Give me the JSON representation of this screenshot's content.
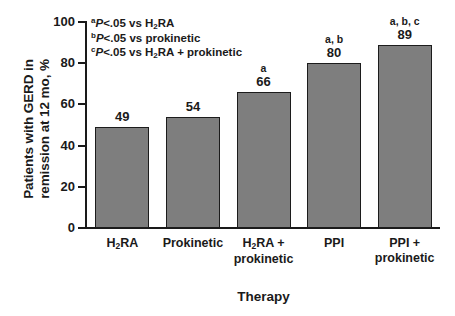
{
  "chart_data": {
    "type": "bar",
    "title": "",
    "categories": [
      "H2RA",
      "Prokinetic",
      "H2RA + prokinetic",
      "PPI",
      "PPI + prokinetic"
    ],
    "category_labels": [
      {
        "line1_pre": "H",
        "line1_sub": "2",
        "line1_post": "RA",
        "line2": ""
      },
      {
        "line1_pre": "Prokinetic",
        "line1_sub": "",
        "line1_post": "",
        "line2": ""
      },
      {
        "line1_pre": "H",
        "line1_sub": "2",
        "line1_post": "RA +",
        "line2": "prokinetic"
      },
      {
        "line1_pre": "PPI",
        "line1_sub": "",
        "line1_post": "",
        "line2": ""
      },
      {
        "line1_pre": "PPI +",
        "line1_sub": "",
        "line1_post": "",
        "line2": "prokinetic"
      }
    ],
    "values": [
      49,
      54,
      66,
      80,
      89
    ],
    "value_labels": [
      "49",
      "54",
      "66",
      "80",
      "89"
    ],
    "significance_markers": [
      "",
      "",
      "a",
      "a, b",
      "a, b, c"
    ],
    "xlabel": "Therapy",
    "ylabel_line1_pre": "Patients with GERD in",
    "ylabel_line2": "remission at 12 mo, %",
    "ylim": [
      0,
      100
    ],
    "yticks": [
      0,
      20,
      40,
      60,
      80,
      100
    ],
    "ytick_labels": [
      "0",
      "20",
      "40",
      "60",
      "80",
      "100"
    ],
    "grid": false,
    "legend_position": "none",
    "bar_color": "#7e7e7e",
    "bar_edge_color": "#1c1c1c",
    "annotations": [
      {
        "sup": "a",
        "italic": "P",
        "text_pre": "<.05 vs H",
        "sub": "2",
        "text_post": "RA"
      },
      {
        "sup": "b",
        "italic": "P",
        "text_pre": "<.05 vs prokinetic",
        "sub": "",
        "text_post": ""
      },
      {
        "sup": "c",
        "italic": "P",
        "text_pre": "<.05 vs H",
        "sub": "2",
        "text_post": "RA + prokinetic"
      }
    ]
  }
}
